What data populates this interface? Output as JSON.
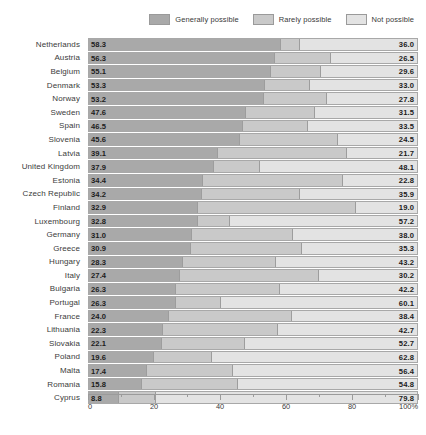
{
  "chart_data": {
    "type": "bar",
    "orientation": "horizontal",
    "stacked": true,
    "normalized_percent": true,
    "title": "",
    "subtitle": "",
    "xlabel": "",
    "ylabel": "",
    "xlim": [
      0,
      100
    ],
    "xticks": [
      0,
      20,
      40,
      60,
      80,
      100
    ],
    "xtick_labels": [
      "0",
      "20",
      "40",
      "60",
      "80",
      "100%"
    ],
    "minor_xticks": [
      10,
      30,
      50,
      70,
      90
    ],
    "grid": false,
    "legend_position": "top-right",
    "legend": [
      "Generally possible",
      "Rarely possible",
      "Not possible"
    ],
    "series_colors": [
      "#a9a9a9",
      "#c9c9c9",
      "#e3e3e3"
    ],
    "categories": [
      "Netherlands",
      "Austria",
      "Belgium",
      "Denmark",
      "Norway",
      "Sweden",
      "Spain",
      "Slovenia",
      "Latvia",
      "United Kingdom",
      "Estonia",
      "Czech Republic",
      "Finland",
      "Luxembourg",
      "Germany",
      "Greece",
      "Hungary",
      "Italy",
      "Bulgaria",
      "Portugal",
      "France",
      "Lithuania",
      "Slovakia",
      "Poland",
      "Malta",
      "Romania",
      "Cyprus"
    ],
    "series": [
      {
        "name": "Generally possible",
        "values": [
          58.3,
          56.3,
          55.1,
          53.3,
          53.2,
          47.6,
          46.5,
          45.6,
          39.1,
          37.9,
          34.4,
          34.2,
          32.9,
          32.8,
          31.0,
          30.9,
          28.3,
          27.4,
          26.3,
          26.3,
          24.0,
          22.3,
          22.1,
          19.6,
          17.4,
          15.8,
          8.8
        ]
      },
      {
        "name": "Rarely possible",
        "values": [
          5.7,
          17.2,
          15.3,
          13.7,
          19.0,
          20.9,
          20.0,
          29.9,
          39.2,
          14.0,
          42.8,
          29.9,
          48.1,
          10.0,
          31.0,
          33.8,
          28.5,
          42.4,
          31.5,
          13.6,
          37.6,
          35.0,
          25.2,
          17.6,
          26.2,
          29.4,
          11.4
        ]
      },
      {
        "name": "Not possible",
        "values": [
          36.0,
          26.5,
          29.6,
          33.0,
          27.8,
          31.5,
          33.5,
          24.5,
          21.7,
          48.1,
          22.8,
          35.9,
          19.0,
          57.2,
          38.0,
          35.3,
          43.2,
          30.2,
          42.2,
          60.1,
          38.4,
          42.7,
          52.7,
          62.8,
          56.4,
          54.8,
          79.8
        ]
      }
    ],
    "labeled_values": {
      "left_labels": [
        58.3,
        56.3,
        55.1,
        53.3,
        53.2,
        47.6,
        46.5,
        45.6,
        39.1,
        37.9,
        34.4,
        34.2,
        32.9,
        32.8,
        31.0,
        30.9,
        28.3,
        27.4,
        26.3,
        26.3,
        24.0,
        22.3,
        22.1,
        19.6,
        17.4,
        15.8,
        8.8
      ],
      "right_labels": [
        36.0,
        26.5,
        29.6,
        33.0,
        27.8,
        31.5,
        33.5,
        24.5,
        21.7,
        48.1,
        22.8,
        35.9,
        19.0,
        57.2,
        38.0,
        35.3,
        43.2,
        30.2,
        42.2,
        60.1,
        38.4,
        42.7,
        52.7,
        62.8,
        56.4,
        54.8,
        79.8
      ]
    }
  },
  "legend": {
    "items": [
      {
        "label": "Generally possible",
        "color": "#a9a9a9"
      },
      {
        "label": "Rarely possible",
        "color": "#c9c9c9"
      },
      {
        "label": "Not possible",
        "color": "#e3e3e3"
      }
    ]
  },
  "axis": {
    "tick_labels": [
      "0",
      "20",
      "40",
      "60",
      "80",
      "100%"
    ]
  }
}
